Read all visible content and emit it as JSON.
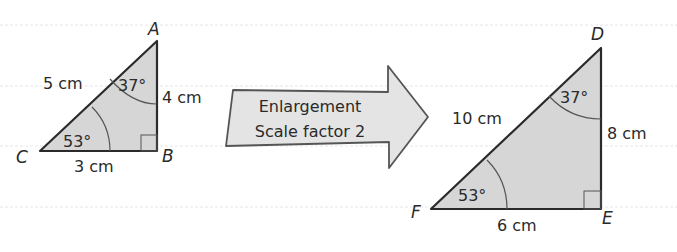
{
  "colors": {
    "background": "#ffffff",
    "triangle_fill": "#d6d6d6",
    "outline": "#2a2a2a",
    "arrow_fill": "#e4e4e4",
    "ruled_line": "#e6e6e6"
  },
  "small_triangle": {
    "vertices": {
      "A": "A",
      "B": "B",
      "C": "C"
    },
    "sides": {
      "AC": "5 cm",
      "AB": "4 cm",
      "CB": "3 cm"
    },
    "angles": {
      "A": "37°",
      "C": "53°"
    }
  },
  "arrow": {
    "line1": "Enlargement",
    "line2": "Scale factor 2"
  },
  "large_triangle": {
    "vertices": {
      "D": "D",
      "E": "E",
      "F": "F"
    },
    "sides": {
      "FD": "10 cm",
      "DE": "8 cm",
      "FE": "6 cm"
    },
    "angles": {
      "D": "37°",
      "F": "53°"
    }
  }
}
